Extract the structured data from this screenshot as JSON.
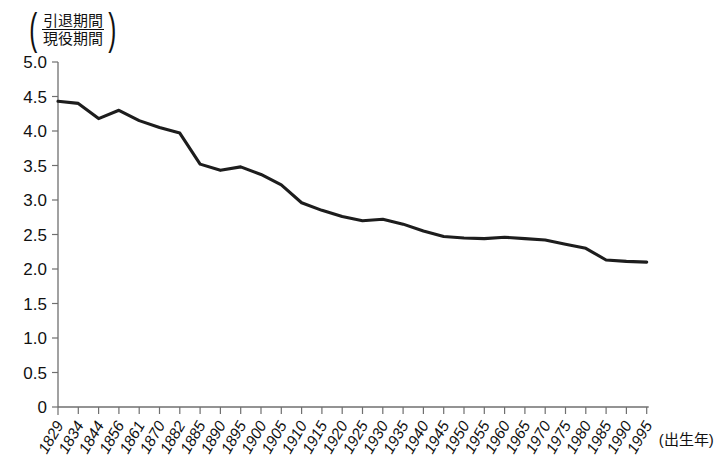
{
  "chart_data": {
    "type": "line",
    "title": "",
    "subtitle": "",
    "ylabel_numerator": "引退期間",
    "ylabel_denominator": "現役期間",
    "ylabel_open_paren": "(",
    "ylabel_close_paren": ")",
    "xlabel": "(出生年)",
    "ylim": [
      0,
      5.0
    ],
    "ytick_labels": [
      "5.0",
      "4.5",
      "4.0",
      "3.5",
      "3.0",
      "2.5",
      "2.0",
      "1.5",
      "1.0",
      "0.5",
      "0"
    ],
    "ytick_values": [
      5.0,
      4.5,
      4.0,
      3.5,
      3.0,
      2.5,
      2.0,
      1.5,
      1.0,
      0.5,
      0
    ],
    "grid": false,
    "legend": "none",
    "categories": [
      "1829",
      "1834",
      "1844",
      "1856",
      "1861",
      "1870",
      "1882",
      "1885",
      "1890",
      "1895",
      "1900",
      "1905",
      "1910",
      "1915",
      "1920",
      "1925",
      "1930",
      "1935",
      "1940",
      "1945",
      "1950",
      "1955",
      "1960",
      "1965",
      "1970",
      "1975",
      "1980",
      "1985",
      "1990",
      "1995"
    ],
    "values": [
      4.43,
      4.4,
      4.18,
      4.3,
      4.15,
      4.05,
      3.97,
      3.52,
      3.43,
      3.48,
      3.37,
      3.22,
      2.96,
      2.85,
      2.76,
      2.7,
      2.72,
      2.65,
      2.55,
      2.47,
      2.45,
      2.44,
      2.46,
      2.44,
      2.42,
      2.36,
      2.3,
      2.13,
      2.11,
      2.1
    ],
    "series_name": "引退期間/現役期間",
    "line_color": "#1d1d1d"
  },
  "axis": {
    "y_tick_count": 11,
    "x_tick_count": 30
  }
}
